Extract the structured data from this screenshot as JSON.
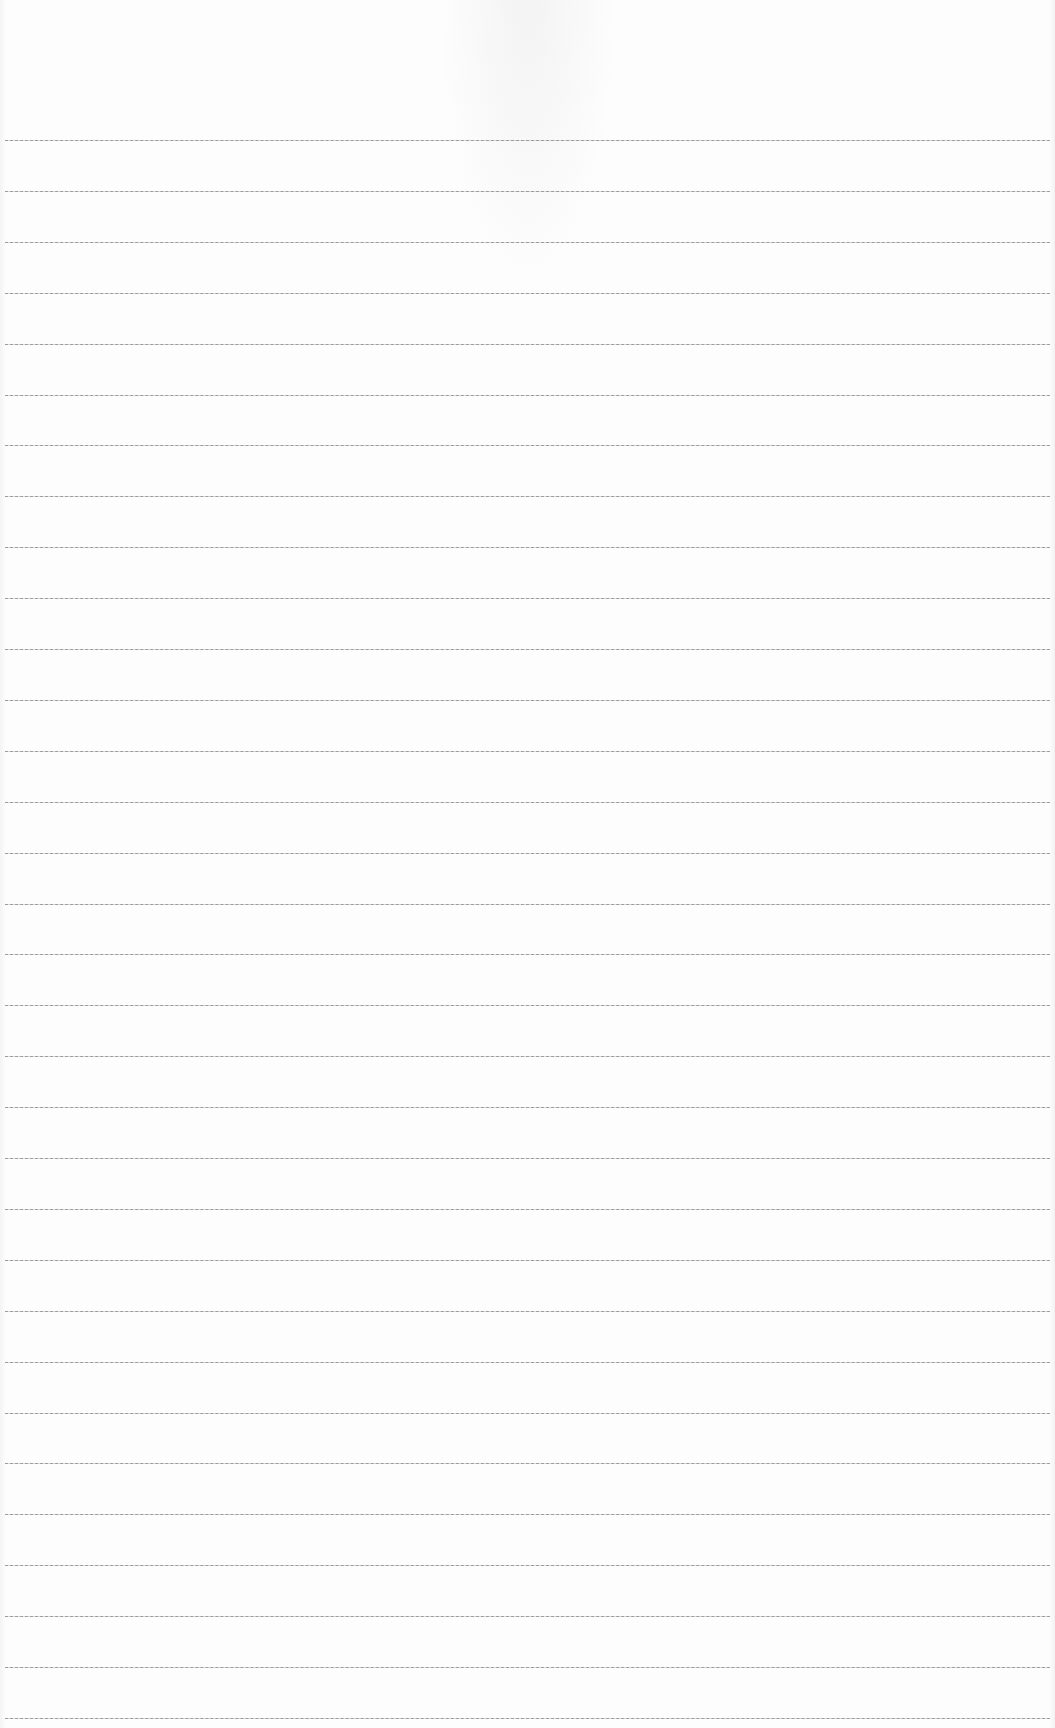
{
  "page": {
    "type": "blank-ruled-sheet",
    "background_color": "#fdfdfd",
    "line_color": "#8d8d8d",
    "line_count": 34,
    "line_start_x": 5,
    "line_end_x": 1050,
    "first_line_y": 140,
    "line_spacing": 50.9,
    "text_content": ""
  }
}
